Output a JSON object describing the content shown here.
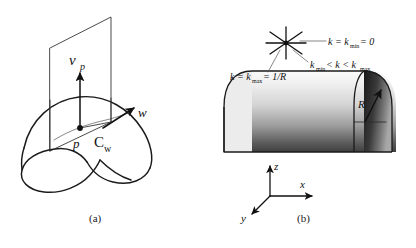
{
  "figure": {
    "background_color": "#ffffff",
    "ink_color": "#1b1b1b",
    "panels": [
      {
        "id": "a",
        "caption": "(a)",
        "kind": "normal-section-of-surface",
        "labels": {
          "normal_vector": "ν",
          "normal_vector_subscript": "p",
          "point": "p",
          "curve": "C",
          "curve_subscript": "w",
          "tangent_vector": "w"
        }
      },
      {
        "id": "b",
        "caption": "(b)",
        "kind": "half-cylinder-curvature",
        "annotations": {
          "min_curvature": "k = k",
          "min_curvature_sub": "min",
          "min_curvature_tail": " = 0",
          "max_curvature": "k = k",
          "max_curvature_sub": "max",
          "max_curvature_tail": " = 1/R",
          "between_left": "k",
          "between_left_sub": "min",
          "between_mid": " < k < k",
          "between_right_sub": "max",
          "radius": "R"
        },
        "axes": {
          "z": "z",
          "x": "x",
          "y": "y"
        },
        "cylinder_shading": {
          "top_color": "#f3f3f3",
          "mid_color": "#d2d2d2",
          "bottom_color": "#4a4a4a",
          "cap_dark": "#1d1d1d",
          "cap_light": "#8d8d8d"
        }
      }
    ]
  }
}
